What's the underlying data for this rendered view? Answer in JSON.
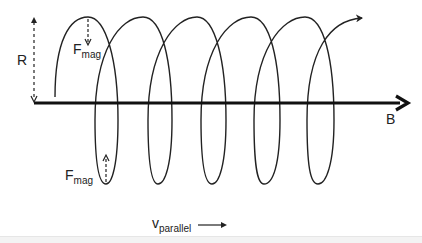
{
  "diagram": {
    "labels": {
      "radius": "R",
      "field": "B",
      "force_top_main": "F",
      "force_top_sub": "mag",
      "force_bottom_main": "F",
      "force_bottom_sub": "mag",
      "velocity_main": "v",
      "velocity_sub": "parallel"
    },
    "colors": {
      "stroke": "#222222",
      "background": "#ffffff"
    },
    "helix": {
      "loops": 5,
      "tops_x": [
        88,
        143,
        197,
        251,
        305
      ],
      "bottoms_x": [
        106,
        158,
        212,
        264,
        318
      ],
      "top_y": 17,
      "bottom_y": 184
    }
  }
}
